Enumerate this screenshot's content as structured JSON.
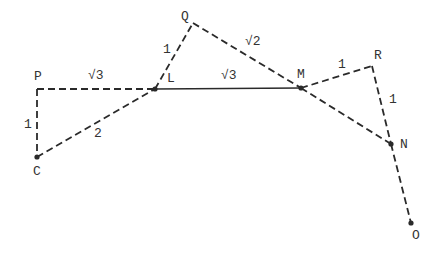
{
  "diagram": {
    "points": [
      {
        "id": "P",
        "label": "P",
        "x": 37,
        "y": 89,
        "lx": 34,
        "ly": 80,
        "dot": false
      },
      {
        "id": "L",
        "label": "L",
        "x": 155,
        "y": 89,
        "lx": 167,
        "ly": 82,
        "dot": true
      },
      {
        "id": "Q",
        "label": "Q",
        "x": 193,
        "y": 23,
        "lx": 181,
        "ly": 20,
        "dot": false
      },
      {
        "id": "M",
        "label": "M",
        "x": 301,
        "y": 88,
        "lx": 297,
        "ly": 78,
        "dot": true
      },
      {
        "id": "R",
        "label": "R",
        "x": 372,
        "y": 66,
        "lx": 374,
        "ly": 59,
        "dot": false
      },
      {
        "id": "N",
        "label": "N",
        "x": 391,
        "y": 144,
        "lx": 400,
        "ly": 148,
        "dot": true
      },
      {
        "id": "C",
        "label": "C",
        "x": 37,
        "y": 157,
        "lx": 33,
        "ly": 175,
        "dot": true
      },
      {
        "id": "O",
        "label": "O",
        "x": 411,
        "y": 223,
        "lx": 412,
        "ly": 239,
        "dot": true
      }
    ],
    "segments": [
      {
        "from": "P",
        "to": "L",
        "style": "dashed",
        "length_label": "√3",
        "lx": 88,
        "ly": 79
      },
      {
        "from": "P",
        "to": "C",
        "style": "dashed",
        "length_label": "1",
        "lx": 24,
        "ly": 128
      },
      {
        "from": "C",
        "to": "L",
        "style": "dashed",
        "length_label": "2",
        "lx": 94,
        "ly": 137
      },
      {
        "from": "L",
        "to": "Q",
        "style": "dashed",
        "length_label": "1",
        "lx": 163,
        "ly": 53
      },
      {
        "from": "Q",
        "to": "M",
        "style": "dashed",
        "length_label": "√2",
        "lx": 245,
        "ly": 45
      },
      {
        "from": "L",
        "to": "M",
        "style": "solid",
        "length_label": "√3",
        "lx": 221,
        "ly": 79
      },
      {
        "from": "M",
        "to": "R",
        "style": "dashed",
        "length_label": "1",
        "lx": 338,
        "ly": 68
      },
      {
        "from": "R",
        "to": "N",
        "style": "dashed",
        "length_label": "1",
        "lx": 389,
        "ly": 103
      },
      {
        "from": "M",
        "to": "N",
        "style": "dashed",
        "length_label": "",
        "lx": 0,
        "ly": 0
      },
      {
        "from": "N",
        "to": "O",
        "style": "dashed",
        "length_label": "",
        "lx": 0,
        "ly": 0
      }
    ],
    "colors": {
      "stroke": "#2a2a2a",
      "text": "#333333",
      "background": "#ffffff"
    }
  }
}
